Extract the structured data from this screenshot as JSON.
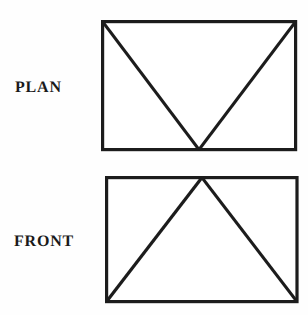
{
  "document": {
    "title": "Orthographic Projection - Plan and Front Views",
    "background_color": "#fefefe",
    "ink_color": "#1c1c1c"
  },
  "views": [
    {
      "id": "plan",
      "label": "PLAN",
      "icon_name": "plan-view-diagram",
      "shape_description": "rectangle with two diagonal lines from the top-left and top-right corners meeting at the midpoint of the bottom edge, forming a V",
      "rect": {
        "x": 101,
        "y": 20,
        "width": 196,
        "height": 131
      },
      "vertex_apex": {
        "x": 200,
        "y": 151
      },
      "line_color": "#1c1c1c",
      "line_width": 3
    },
    {
      "id": "front",
      "label": "FRONT",
      "icon_name": "front-view-diagram",
      "shape_description": "rectangle with two diagonal lines from the midpoint of the top edge down to the bottom-left and bottom-right corners, forming an inverted V",
      "rect": {
        "x": 105,
        "y": 176,
        "width": 193,
        "height": 126
      },
      "vertex_apex": {
        "x": 202,
        "y": 176
      },
      "line_color": "#1c1c1c",
      "line_width": 3
    }
  ]
}
